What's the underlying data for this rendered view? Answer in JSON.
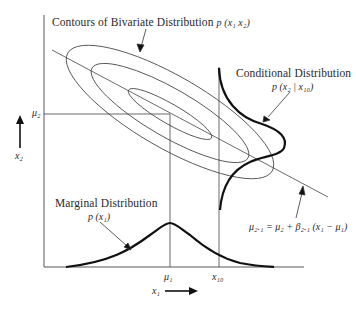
{
  "diagram": {
    "labels": {
      "contours_title": "Contours of Bivariate Distribution",
      "contours_formula": "p (x₁ x₂)",
      "conditional_title": "Conditional Distribution",
      "conditional_formula": "p (x₂ | x₁₀)",
      "marginal_title": "Marginal Distribution",
      "marginal_formula": "p (x₁)",
      "regression_formula": "μ₂.₁ = μ₂ + β₂.₁ (x₁ − μ₁)",
      "mu2": "μ₂",
      "mu1": "μ₁",
      "x10": "x₁₀",
      "x2_axis": "x₂",
      "x1_axis": "x₁"
    },
    "colors": {
      "line": "#3a3a3a",
      "curve": "#111111",
      "text": "#2a2a2a"
    }
  }
}
